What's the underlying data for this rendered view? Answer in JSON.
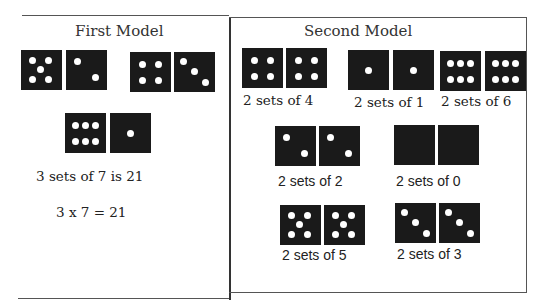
{
  "first_model": {
    "title": "First Model",
    "dice": [
      {
        "value": 5,
        "x": 21,
        "y": 50
      },
      {
        "value": 2,
        "x": 66,
        "y": 50
      },
      {
        "value": 4,
        "x": 130,
        "y": 52
      },
      {
        "value": 3,
        "x": 174,
        "y": 52
      },
      {
        "value": 6,
        "x": 65,
        "y": 113
      },
      {
        "value": 1,
        "x": 110,
        "y": 113
      }
    ],
    "statement": "3 sets of 7 is 21",
    "equation": "3 x 7 = 21"
  },
  "second_model": {
    "title": "Second Model",
    "groups": [
      {
        "label": "2 sets of 4",
        "value": 4,
        "dice": [
          {
            "x": 242,
            "y": 48
          },
          {
            "x": 286,
            "y": 48
          }
        ],
        "label_x": 243,
        "label_y": 92
      },
      {
        "label": "2 sets of 1",
        "value": 1,
        "dice": [
          {
            "x": 348,
            "y": 50
          },
          {
            "x": 393,
            "y": 50
          }
        ],
        "label_x": 354,
        "label_y": 94
      },
      {
        "label": "2 sets of 6",
        "value": 6,
        "dice": [
          {
            "x": 440,
            "y": 51
          },
          {
            "x": 485,
            "y": 51
          }
        ],
        "label_x": 441,
        "label_y": 93
      },
      {
        "label": "2 sets of 2",
        "value": 2,
        "dice": [
          {
            "x": 275,
            "y": 126
          },
          {
            "x": 319,
            "y": 126
          }
        ],
        "label_x": 278,
        "label_y": 173
      },
      {
        "label": "2 sets of 0",
        "value": 0,
        "dice": [
          {
            "x": 394,
            "y": 125
          },
          {
            "x": 438,
            "y": 125
          }
        ],
        "label_x": 396,
        "label_y": 173
      },
      {
        "label": "2 sets of 5",
        "value": 5,
        "dice": [
          {
            "x": 280,
            "y": 205
          },
          {
            "x": 324,
            "y": 205
          }
        ],
        "label_x": 282,
        "label_y": 247
      },
      {
        "label": "2 sets of 3",
        "value": 3,
        "dice": [
          {
            "x": 395,
            "y": 203
          },
          {
            "x": 439,
            "y": 203
          }
        ],
        "label_x": 397,
        "label_y": 246
      }
    ]
  },
  "colors": {
    "die": "#1a1a1a",
    "pip": "#ffffff",
    "border": "#555555"
  }
}
